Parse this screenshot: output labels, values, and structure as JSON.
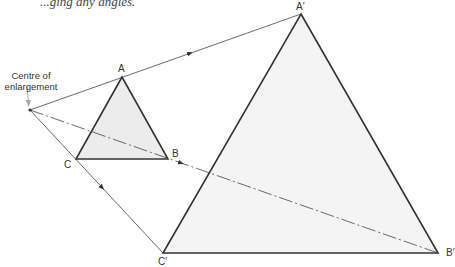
{
  "caption": "...ging any angles.",
  "centre_label_line1": "Centre of",
  "centre_label_line2": "enlargement",
  "vertices": {
    "A": "A",
    "B": "B",
    "C": "C",
    "A_prime": "A′",
    "B_prime": "B′",
    "C_prime": "C′"
  },
  "colors": {
    "line": "#333333",
    "fill": "#f2f2f2",
    "pointer": "#aaaaaa"
  }
}
